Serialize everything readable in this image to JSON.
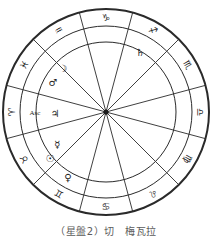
{
  "figure": {
    "caption": "（星盤2）切　梅瓦拉",
    "background_color": "#ffffff",
    "line_color": "#2a2a2a"
  },
  "chart_data": {
    "type": "pie",
    "xlabel": "",
    "ylabel": "",
    "grid": false,
    "legend_position": "none",
    "geometry": {
      "center_x": 106,
      "center_y": 112,
      "outer_radius": 103,
      "mid_radius": 86,
      "inner_radius": 70,
      "spoke_count": 12,
      "sector_span_degrees": 30,
      "first_sector_center_degrees": 270,
      "direction": "counter-clockwise"
    },
    "categories": [
      "Capricorn",
      "Aquarius",
      "Pisces",
      "Aries",
      "Taurus",
      "Gemini",
      "Cancer",
      "Leo",
      "Virgo",
      "Libra",
      "Scorpio",
      "Sagittarius"
    ],
    "values": [
      30,
      30,
      30,
      30,
      30,
      30,
      30,
      30,
      30,
      30,
      30,
      30
    ],
    "signs": [
      {
        "name": "Capricorn",
        "glyph": "♑",
        "angle_deg": 270,
        "rotate_deg": 0
      },
      {
        "name": "Aquarius",
        "glyph": "♒",
        "angle_deg": 240,
        "rotate_deg": -30
      },
      {
        "name": "Pisces",
        "glyph": "♓",
        "angle_deg": 210,
        "rotate_deg": -60
      },
      {
        "name": "Aries",
        "glyph": "♈",
        "angle_deg": 180,
        "rotate_deg": -90
      },
      {
        "name": "Taurus",
        "glyph": "♉",
        "angle_deg": 150,
        "rotate_deg": -120
      },
      {
        "name": "Gemini",
        "glyph": "♊",
        "angle_deg": 120,
        "rotate_deg": -150
      },
      {
        "name": "Cancer",
        "glyph": "♋",
        "angle_deg": 90,
        "rotate_deg": 180
      },
      {
        "name": "Leo",
        "glyph": "♌",
        "angle_deg": 60,
        "rotate_deg": 150
      },
      {
        "name": "Virgo",
        "glyph": "♍",
        "angle_deg": 30,
        "rotate_deg": 120
      },
      {
        "name": "Libra",
        "glyph": "♎",
        "angle_deg": 0,
        "rotate_deg": 90
      },
      {
        "name": "Scorpio",
        "glyph": "♏",
        "angle_deg": 330,
        "rotate_deg": 60
      },
      {
        "name": "Sagittarius",
        "glyph": "♐",
        "angle_deg": 300,
        "rotate_deg": 30
      }
    ],
    "planets": [
      {
        "name": "Saturn",
        "glyph": "♄",
        "x": 140,
        "y": 52
      },
      {
        "name": "Moon",
        "glyph": "☽",
        "x": 63,
        "y": 68
      },
      {
        "name": "Mars",
        "glyph": "♂",
        "x": 53,
        "y": 82
      },
      {
        "name": "Jupiter",
        "glyph": "♃",
        "x": 55,
        "y": 113
      },
      {
        "name": "Mercury",
        "glyph": "☿",
        "x": 57,
        "y": 144
      },
      {
        "name": "Sun",
        "glyph": "☉",
        "x": 50,
        "y": 158
      },
      {
        "name": "Venus",
        "glyph": "♀",
        "x": 68,
        "y": 177
      }
    ],
    "points": [
      {
        "name": "Ascendant",
        "label": "Asc",
        "x": 35,
        "y": 113
      }
    ]
  }
}
